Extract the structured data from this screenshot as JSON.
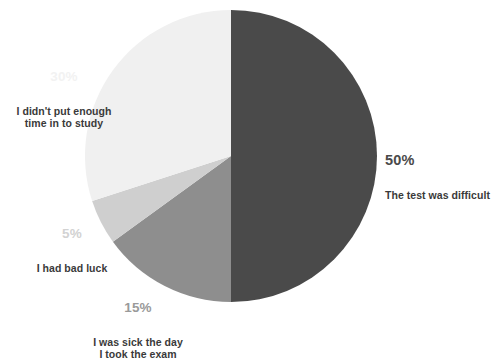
{
  "chart_data": {
    "type": "pie",
    "title": "",
    "subtitle": "",
    "xlabel": "",
    "ylabel": "",
    "legend_position": "callout-labels",
    "grid": false,
    "total": 100,
    "units": "%",
    "start_angle_deg": 0,
    "direction": "clockwise",
    "categories": [
      "The test was difficult",
      "I was sick the day\nI took the exam",
      "I had bad luck",
      "I didn't put enough\ntime in to study"
    ],
    "values": [
      50,
      15,
      5,
      30
    ],
    "value_labels": [
      "50%",
      "15%",
      "5%",
      "30%"
    ],
    "colors": [
      "#4a4a4a",
      "#8e8e8e",
      "#cfcfcf",
      "#f0f0f0"
    ],
    "slices": [
      {
        "name": "test-difficult",
        "value": 50,
        "value_label": "50%",
        "label": "The test was difficult",
        "color": "#4a4a4a",
        "label_color": "#4a4a4a",
        "start_deg": 0,
        "end_deg": 180
      },
      {
        "name": "sick-on-exam-day",
        "value": 15,
        "value_label": "15%",
        "label": "I was sick the day\nI took the exam",
        "color": "#8e8e8e",
        "label_color": "#9a9a9a",
        "start_deg": 180,
        "end_deg": 234
      },
      {
        "name": "bad-luck",
        "value": 5,
        "value_label": "5%",
        "label": "I had bad luck",
        "color": "#cfcfcf",
        "label_color": "#d2d2d2",
        "start_deg": 234,
        "end_deg": 252
      },
      {
        "name": "not-enough-study-time",
        "value": 30,
        "value_label": "30%",
        "label": "I didn't put enough\ntime in to study",
        "color": "#f0f0f0",
        "label_color": "#f2f2f2",
        "start_deg": 252,
        "end_deg": 360
      }
    ],
    "geometry": {
      "center_x": 231,
      "center_y": 156,
      "radius": 146
    },
    "background_color": "#ffffff"
  }
}
